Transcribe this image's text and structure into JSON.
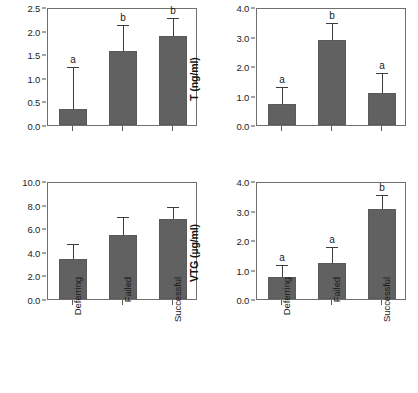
{
  "figure": {
    "categories": [
      "Deferring",
      "Failed",
      "Successful"
    ],
    "bar_color": "#616161",
    "axis_color": "#6f6f6f",
    "error_color": "#3d3d3d"
  },
  "chart_data": [
    {
      "type": "bar",
      "panel": "top-left",
      "title": "",
      "xlabel": "",
      "ylabel": "P4 (ng/ml)",
      "categories": [
        "Deferring",
        "Failed",
        "Successful"
      ],
      "values": [
        0.33,
        1.57,
        1.89
      ],
      "errors_upper": [
        0.87,
        0.53,
        0.36
      ],
      "error_tops": [
        1.2,
        2.1,
        2.25
      ],
      "annotations": [
        "a",
        "b",
        "b"
      ],
      "ylim": [
        0.0,
        2.5
      ],
      "yticks": [
        "0.0",
        "0.5",
        "1.0",
        "1.5",
        "2.0",
        "2.5"
      ],
      "ytick_values": [
        0.0,
        0.5,
        1.0,
        1.5,
        2.0,
        2.5
      ],
      "grid": false,
      "legend": "none"
    },
    {
      "type": "bar",
      "panel": "top-right",
      "title": "",
      "xlabel": "",
      "ylabel": "T (ng/ml)",
      "categories": [
        "Deferring",
        "Failed",
        "Successful"
      ],
      "values": [
        0.72,
        2.88,
        1.1
      ],
      "errors_upper": [
        0.53,
        0.54,
        0.62
      ],
      "error_tops": [
        1.25,
        3.42,
        1.72
      ],
      "annotations": [
        "a",
        "b",
        "a"
      ],
      "ylim": [
        0.0,
        4.0
      ],
      "yticks": [
        "0.0",
        "1.0",
        "2.0",
        "3.0",
        "4.0"
      ],
      "ytick_values": [
        0.0,
        1.0,
        2.0,
        3.0,
        4.0
      ],
      "grid": false,
      "legend": "none"
    },
    {
      "type": "bar",
      "panel": "bottom-left",
      "title": "",
      "xlabel": "",
      "ylabel": "VLDLy (mmol/l)",
      "categories": [
        "Deferring",
        "Failed",
        "Successful"
      ],
      "values": [
        3.35,
        5.4,
        6.75
      ],
      "errors_upper": [
        1.2,
        1.45,
        1.0
      ],
      "error_tops": [
        4.55,
        6.85,
        7.75
      ],
      "annotations": [
        "",
        "",
        ""
      ],
      "ylim": [
        0.0,
        10.0
      ],
      "yticks": [
        "0.0",
        "2.0",
        "4.0",
        "6.0",
        "8.0",
        "10.0"
      ],
      "ytick_values": [
        0.0,
        2.0,
        4.0,
        6.0,
        8.0,
        10.0
      ],
      "grid": false,
      "legend": "none"
    },
    {
      "type": "bar",
      "panel": "bottom-right",
      "title": "",
      "xlabel": "",
      "ylabel": "VTG (µg/ml)",
      "categories": [
        "Deferring",
        "Failed",
        "Successful"
      ],
      "values": [
        0.75,
        1.22,
        3.05
      ],
      "errors_upper": [
        0.37,
        0.51,
        0.43
      ],
      "error_tops": [
        1.12,
        1.73,
        3.48
      ],
      "annotations": [
        "a",
        "a",
        "b"
      ],
      "ylim": [
        0.0,
        4.0
      ],
      "yticks": [
        "0.0",
        "1.0",
        "2.0",
        "3.0",
        "4.0"
      ],
      "ytick_values": [
        0.0,
        1.0,
        2.0,
        3.0,
        4.0
      ],
      "grid": false,
      "legend": "none"
    }
  ]
}
